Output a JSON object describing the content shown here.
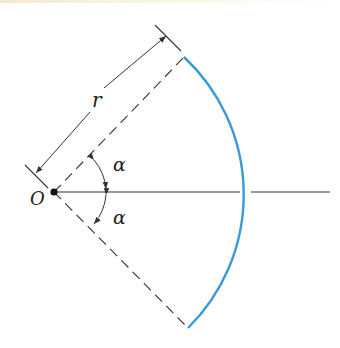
{
  "diagram": {
    "type": "circular-arc-geometry",
    "labels": {
      "radius": "r",
      "origin": "O",
      "angle_upper": "α",
      "angle_lower": "α"
    },
    "colors": {
      "arc": "#3a9ad9",
      "lines": "#333333",
      "background": "#ffffff"
    },
    "geometry": {
      "origin": [
        54,
        192
      ],
      "arc_top_end": [
        184,
        57
      ],
      "arc_bottom_end": [
        188,
        328
      ],
      "arc_axis_crossing": [
        245,
        192
      ],
      "axis_end_x": 330
    }
  }
}
